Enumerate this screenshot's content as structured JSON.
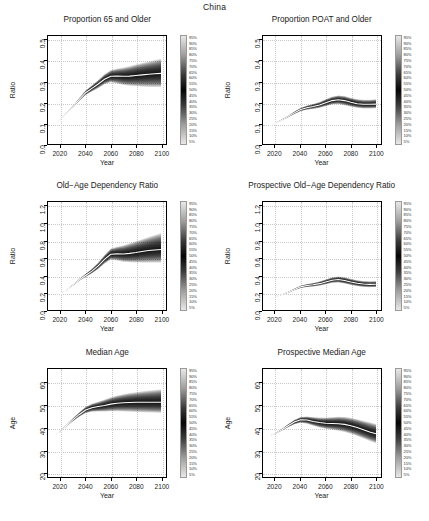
{
  "figure": {
    "main_title": "China",
    "background": "#ffffff",
    "axis_color": "#000000",
    "grid_color": "#c9c9c9",
    "median_line_color": "#ffffff",
    "band_color": "#000000"
  },
  "legend": {
    "name": "probability-interval-colorbar",
    "labels": [
      "95%",
      "90%",
      "85%",
      "80%",
      "75%",
      "70%",
      "65%",
      "60%",
      "55%",
      "50%",
      "45%",
      "40%",
      "35%",
      "30%",
      "25%",
      "20%",
      "15%",
      "10%",
      "5%"
    ],
    "light_end": "#e8e8e8",
    "dark_center": "#050505"
  },
  "chart_data": [
    {
      "id": "proportion-65-and-older",
      "type": "area",
      "title": "Proportion 65 and Older",
      "xlabel": "Year",
      "ylabel": "Ratio",
      "xlim": [
        2010,
        2104
      ],
      "ylim": [
        0.0,
        0.52
      ],
      "xticks": [
        2020,
        2040,
        2060,
        2080,
        2100
      ],
      "yticks": [
        0.0,
        0.1,
        0.2,
        0.3,
        0.4,
        0.5
      ],
      "grid": true,
      "legend_position": "right",
      "x": [
        2015,
        2020,
        2025,
        2030,
        2035,
        2040,
        2045,
        2050,
        2055,
        2060,
        2065,
        2070,
        2075,
        2080,
        2085,
        2090,
        2095,
        2100
      ],
      "series": [
        {
          "name": "median",
          "values": [
            0.09,
            0.12,
            0.15,
            0.18,
            0.215,
            0.247,
            0.268,
            0.289,
            0.312,
            0.326,
            0.327,
            0.326,
            0.327,
            0.33,
            0.333,
            0.336,
            0.338,
            0.34
          ]
        },
        {
          "name": "lower_95",
          "values": [
            0.09,
            0.119,
            0.148,
            0.176,
            0.208,
            0.236,
            0.253,
            0.269,
            0.288,
            0.297,
            0.291,
            0.284,
            0.28,
            0.278,
            0.276,
            0.275,
            0.274,
            0.273
          ]
        },
        {
          "name": "upper_95",
          "values": [
            0.09,
            0.121,
            0.152,
            0.184,
            0.222,
            0.258,
            0.283,
            0.308,
            0.336,
            0.356,
            0.363,
            0.368,
            0.375,
            0.383,
            0.39,
            0.397,
            0.404,
            0.411
          ]
        }
      ]
    },
    {
      "id": "proportion-poat-and-older",
      "type": "area",
      "title": "Proportion POAT and Older",
      "xlabel": "Year",
      "ylabel": "Ratio",
      "xlim": [
        2010,
        2104
      ],
      "ylim": [
        0.0,
        0.52
      ],
      "xticks": [
        2020,
        2040,
        2060,
        2080,
        2100
      ],
      "yticks": [
        0.0,
        0.1,
        0.2,
        0.3,
        0.4,
        0.5
      ],
      "grid": true,
      "legend_position": "right",
      "x": [
        2015,
        2020,
        2025,
        2030,
        2035,
        2040,
        2045,
        2050,
        2055,
        2060,
        2065,
        2070,
        2075,
        2080,
        2085,
        2090,
        2095,
        2100
      ],
      "series": [
        {
          "name": "median",
          "values": [
            0.085,
            0.1,
            0.116,
            0.132,
            0.15,
            0.166,
            0.175,
            0.181,
            0.188,
            0.199,
            0.209,
            0.213,
            0.209,
            0.201,
            0.194,
            0.191,
            0.191,
            0.192
          ]
        },
        {
          "name": "lower_95",
          "values": [
            0.085,
            0.099,
            0.113,
            0.128,
            0.144,
            0.158,
            0.165,
            0.169,
            0.174,
            0.182,
            0.19,
            0.192,
            0.187,
            0.18,
            0.174,
            0.171,
            0.171,
            0.172
          ]
        },
        {
          "name": "upper_95",
          "values": [
            0.085,
            0.101,
            0.119,
            0.136,
            0.156,
            0.174,
            0.185,
            0.193,
            0.202,
            0.216,
            0.228,
            0.234,
            0.231,
            0.223,
            0.216,
            0.213,
            0.213,
            0.215
          ]
        }
      ]
    },
    {
      "id": "old-age-dependency-ratio",
      "type": "area",
      "title": "Old−Age Dependency Ratio",
      "xlabel": "Year",
      "ylabel": "Ratio",
      "xlim": [
        2010,
        2104
      ],
      "ylim": [
        0.0,
        1.25
      ],
      "xticks": [
        2020,
        2040,
        2060,
        2080,
        2100
      ],
      "yticks": [
        0.0,
        0.2,
        0.4,
        0.6,
        0.8,
        1.0,
        1.2
      ],
      "grid": true,
      "legend_position": "right",
      "x": [
        2015,
        2020,
        2025,
        2030,
        2035,
        2040,
        2045,
        2050,
        2055,
        2060,
        2065,
        2070,
        2075,
        2080,
        2085,
        2090,
        2095,
        2100
      ],
      "series": [
        {
          "name": "median",
          "values": [
            0.135,
            0.18,
            0.235,
            0.29,
            0.35,
            0.4,
            0.45,
            0.51,
            0.585,
            0.645,
            0.65,
            0.648,
            0.655,
            0.665,
            0.678,
            0.688,
            0.695,
            0.7
          ]
        },
        {
          "name": "lower_95",
          "values": [
            0.135,
            0.178,
            0.231,
            0.283,
            0.338,
            0.382,
            0.424,
            0.474,
            0.537,
            0.583,
            0.573,
            0.558,
            0.552,
            0.549,
            0.548,
            0.548,
            0.548,
            0.548
          ]
        },
        {
          "name": "upper_95",
          "values": [
            0.135,
            0.182,
            0.239,
            0.297,
            0.362,
            0.419,
            0.478,
            0.549,
            0.637,
            0.712,
            0.733,
            0.748,
            0.772,
            0.796,
            0.82,
            0.845,
            0.868,
            0.89
          ]
        }
      ]
    },
    {
      "id": "prospective-old-age-dependency-ratio",
      "type": "area",
      "title": "Prospective Old−Age Dependency Ratio",
      "xlabel": "Year",
      "ylabel": "Ratio",
      "xlim": [
        2010,
        2104
      ],
      "ylim": [
        0.0,
        1.25
      ],
      "xticks": [
        2020,
        2040,
        2060,
        2080,
        2100
      ],
      "yticks": [
        0.0,
        0.2,
        0.4,
        0.6,
        0.8,
        1.0,
        1.2
      ],
      "grid": true,
      "legend_position": "right",
      "x": [
        2015,
        2020,
        2025,
        2030,
        2035,
        2040,
        2045,
        2050,
        2055,
        2060,
        2065,
        2070,
        2075,
        2080,
        2085,
        2090,
        2095,
        2100
      ],
      "series": [
        {
          "name": "median",
          "values": [
            0.13,
            0.152,
            0.178,
            0.205,
            0.238,
            0.268,
            0.283,
            0.292,
            0.305,
            0.325,
            0.345,
            0.352,
            0.342,
            0.325,
            0.31,
            0.3,
            0.297,
            0.298
          ]
        },
        {
          "name": "lower_95",
          "values": [
            0.13,
            0.15,
            0.173,
            0.198,
            0.228,
            0.254,
            0.266,
            0.272,
            0.282,
            0.298,
            0.314,
            0.318,
            0.306,
            0.29,
            0.276,
            0.267,
            0.264,
            0.265
          ]
        },
        {
          "name": "upper_95",
          "values": [
            0.13,
            0.154,
            0.183,
            0.212,
            0.248,
            0.282,
            0.3,
            0.313,
            0.33,
            0.354,
            0.378,
            0.388,
            0.379,
            0.361,
            0.345,
            0.335,
            0.332,
            0.334
          ]
        }
      ]
    },
    {
      "id": "median-age",
      "type": "area",
      "title": "Median Age",
      "xlabel": "Year",
      "ylabel": "Age",
      "xlim": [
        2010,
        2104
      ],
      "ylim": [
        18,
        66
      ],
      "xticks": [
        2020,
        2040,
        2060,
        2080,
        2100
      ],
      "yticks": [
        20,
        30,
        40,
        50,
        60
      ],
      "grid": true,
      "legend_position": "right",
      "x": [
        2015,
        2020,
        2025,
        2030,
        2035,
        2040,
        2045,
        2050,
        2055,
        2060,
        2065,
        2070,
        2075,
        2080,
        2085,
        2090,
        2095,
        2100
      ],
      "series": [
        {
          "name": "median",
          "values": [
            36.2,
            38.5,
            41.0,
            43.5,
            45.8,
            47.8,
            48.8,
            49.3,
            49.8,
            50.4,
            50.8,
            51.0,
            51.1,
            51.2,
            51.2,
            51.2,
            51.2,
            51.2
          ]
        },
        {
          "name": "lower_95",
          "values": [
            36.2,
            38.3,
            40.6,
            42.8,
            44.8,
            46.4,
            47.0,
            47.1,
            47.1,
            47.2,
            47.2,
            47.1,
            47.0,
            46.9,
            46.8,
            46.7,
            46.6,
            46.5
          ]
        },
        {
          "name": "upper_95",
          "values": [
            36.2,
            38.7,
            41.4,
            44.2,
            46.8,
            49.2,
            50.6,
            51.5,
            52.4,
            53.4,
            54.2,
            54.8,
            55.3,
            55.7,
            56.1,
            56.4,
            56.7,
            57.0
          ]
        }
      ]
    },
    {
      "id": "prospective-median-age",
      "type": "area",
      "title": "Prospective Median Age",
      "xlabel": "Year",
      "ylabel": "Age",
      "xlim": [
        2010,
        2104
      ],
      "ylim": [
        18,
        66
      ],
      "xticks": [
        2020,
        2040,
        2060,
        2080,
        2100
      ],
      "yticks": [
        20,
        30,
        40,
        50,
        60
      ],
      "grid": true,
      "legend_position": "right",
      "x": [
        2015,
        2020,
        2025,
        2030,
        2035,
        2040,
        2045,
        2050,
        2055,
        2060,
        2065,
        2070,
        2075,
        2080,
        2085,
        2090,
        2095,
        2100
      ],
      "series": [
        {
          "name": "median",
          "values": [
            36.2,
            37.4,
            39.0,
            40.8,
            42.4,
            43.4,
            43.3,
            42.7,
            42.2,
            41.9,
            41.8,
            41.7,
            41.4,
            40.8,
            40.0,
            39.0,
            38.0,
            37.2
          ]
        },
        {
          "name": "lower_95",
          "values": [
            36.2,
            37.2,
            38.6,
            40.1,
            41.4,
            42.1,
            41.7,
            40.8,
            40.0,
            39.4,
            39.0,
            38.6,
            38.0,
            37.2,
            36.2,
            35.1,
            34.0,
            33.0
          ]
        },
        {
          "name": "upper_95",
          "values": [
            36.2,
            37.6,
            39.4,
            41.5,
            43.4,
            44.7,
            44.9,
            44.6,
            44.4,
            44.4,
            44.6,
            44.8,
            44.7,
            44.3,
            43.7,
            43.0,
            42.3,
            41.6
          ]
        }
      ]
    }
  ]
}
